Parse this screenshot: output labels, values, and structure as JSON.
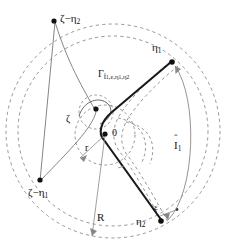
{
  "figure": {
    "width": 228,
    "height": 252,
    "background": "#ffffff",
    "stroke_dark": "#111111",
    "stroke_mid": "#777777",
    "stroke_dash": "#888888"
  },
  "labels": {
    "zeta_minus_eta2": "ζ−η",
    "zeta_minus_eta2_sub": "2",
    "zeta_minus_eta1": "ζ−η",
    "zeta_minus_eta1_sub": "1",
    "eta1": "η",
    "eta1_sub": "1",
    "eta2": "η",
    "eta2_sub": "2",
    "zeta": "ζ",
    "origin": "0",
    "radius_small": "r",
    "radius_big": "R",
    "epsilon": "ε",
    "gamma": "Γ",
    "gamma_sub": "Î",
    "gamma_sub_rest": "1,ε,η",
    "gamma_sub_rest2": "1",
    "gamma_sub_rest3": "η",
    "gamma_sub_rest4": "2",
    "I_hat": "I",
    "I_hat_sub": "1",
    "hat_glyph": "ˆ"
  },
  "points": {
    "zeta_minus_eta2": {
      "x": 53,
      "y": 20
    },
    "zeta_minus_eta1": {
      "x": 39,
      "y": 180
    },
    "eta1": {
      "x": 172,
      "y": 62
    },
    "eta2": {
      "x": 160,
      "y": 222
    },
    "zeta": {
      "x": 95,
      "y": 110
    },
    "origin": {
      "x": 105,
      "y": 135
    }
  },
  "geometry": {
    "outer_circle": {
      "cx": 113,
      "cy": 131,
      "r": 107,
      "style": "dashed"
    },
    "inner_circle_R": {
      "cx": 113,
      "cy": 131,
      "r": 93,
      "style": "dashed"
    },
    "small_circle_r": {
      "cx": 105,
      "cy": 135,
      "r": 30,
      "style": "dashed"
    },
    "zeta_circle": {
      "cx": 95,
      "cy": 110,
      "r": 18,
      "style": "dashed"
    },
    "R_value_label": "R",
    "r_value_label": "r",
    "epsilon_label": "ε"
  }
}
